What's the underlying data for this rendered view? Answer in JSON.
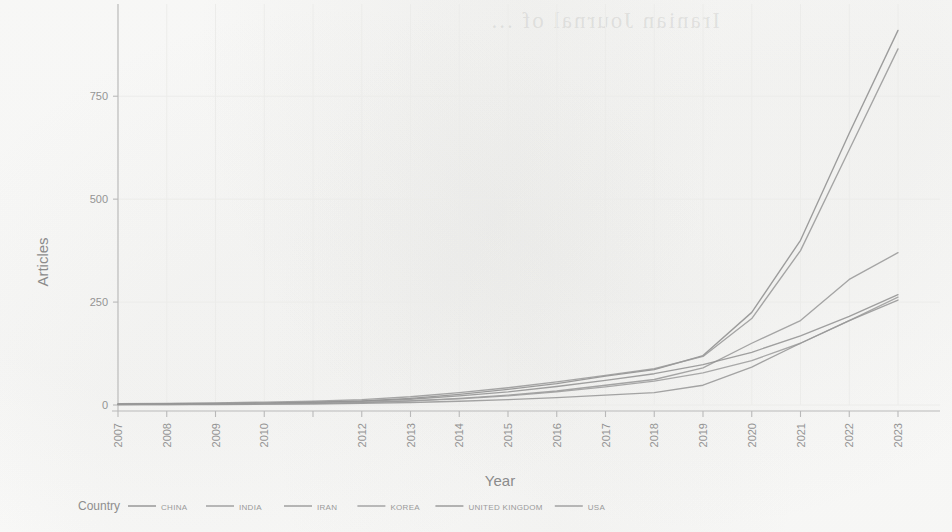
{
  "figure": {
    "background_color": "#fdfdfc",
    "line_color": "#9a9a9a",
    "axis_color": "#b9b9b9",
    "grid_color": "#ececea",
    "text_color": "#949494",
    "bleed_through_text": "Iranian Journal of ..."
  },
  "legend": {
    "title": "Country",
    "position": "bottom",
    "items": [
      {
        "label": "CHINA",
        "color": "#8f8f8f"
      },
      {
        "label": "INDIA",
        "color": "#9a9a9a"
      },
      {
        "label": "IRAN",
        "color": "#979797"
      },
      {
        "label": "KOREA",
        "color": "#9d9d9d"
      },
      {
        "label": "UNITED KINGDOM",
        "color": "#939393"
      },
      {
        "label": "USA",
        "color": "#9a9a9a"
      }
    ]
  },
  "chart_data": {
    "type": "line",
    "title": "",
    "xlabel": "Year",
    "ylabel": "Articles",
    "x": [
      2007,
      2008,
      2009,
      2010,
      2011,
      2012,
      2013,
      2014,
      2015,
      2016,
      2017,
      2018,
      2019,
      2020,
      2021,
      2022,
      2023
    ],
    "xtick_labels": [
      "2007",
      "2008",
      "2009",
      "2010",
      "",
      "2012",
      "2013",
      "2014",
      "2015",
      "2016",
      "2017",
      "2018",
      "2019",
      "2020",
      "2021",
      "2022",
      "2023"
    ],
    "xlim": [
      2007,
      2023
    ],
    "ylim": [
      0,
      940
    ],
    "yticks": [
      0,
      250,
      500,
      750
    ],
    "ytick_labels": [
      "0",
      "250",
      "500",
      "750"
    ],
    "grid": true,
    "legend_position": "bottom",
    "series": [
      {
        "name": "CHINA",
        "values": [
          2,
          3,
          4,
          5,
          7,
          10,
          16,
          26,
          38,
          52,
          70,
          86,
          120,
          225,
          400,
          660,
          910
        ]
      },
      {
        "name": "USA",
        "values": [
          3,
          4,
          5,
          7,
          9,
          13,
          20,
          30,
          42,
          56,
          72,
          88,
          118,
          210,
          375,
          620,
          865
        ]
      },
      {
        "name": "INDIA",
        "values": [
          1,
          2,
          2,
          3,
          4,
          6,
          10,
          16,
          24,
          34,
          48,
          62,
          90,
          150,
          205,
          305,
          370
        ]
      },
      {
        "name": "UNITED KINGDOM",
        "values": [
          2,
          2,
          3,
          4,
          6,
          9,
          14,
          22,
          32,
          45,
          60,
          76,
          98,
          128,
          168,
          215,
          268
        ]
      },
      {
        "name": "KOREA",
        "values": [
          1,
          1,
          2,
          3,
          4,
          6,
          10,
          15,
          22,
          32,
          44,
          58,
          78,
          108,
          150,
          205,
          262
        ]
      },
      {
        "name": "IRAN",
        "values": [
          1,
          1,
          1,
          2,
          2,
          4,
          6,
          9,
          13,
          18,
          24,
          30,
          48,
          92,
          150,
          205,
          255
        ]
      }
    ]
  }
}
